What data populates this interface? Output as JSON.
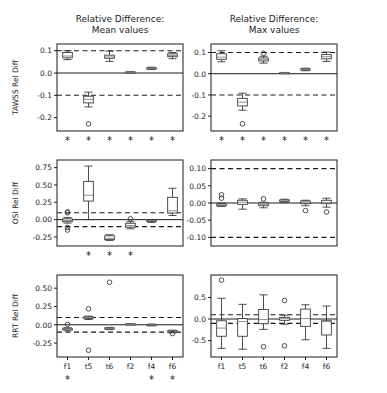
{
  "figure": {
    "width": 387,
    "height": 393,
    "background": "#ffffff",
    "foreground": "#1a1a1a",
    "median_color": "#808080",
    "box_edge_color": "#3a3a3a"
  },
  "column_titles": [
    {
      "line1": "Relative Difference:",
      "line2": "Mean values"
    },
    {
      "line1": "Relative Difference:",
      "line2": "Max values"
    }
  ],
  "row_labels": [
    "TAWSS Rel Diff",
    "OSI Rel Diff",
    "RRT Rel Diff"
  ],
  "categories": [
    "f1",
    "t5",
    "t6",
    "f2",
    "f4",
    "f6"
  ],
  "significance_marker": "*",
  "chart_data": {
    "type": "box",
    "xlabel": "",
    "grid": false,
    "legend": "none",
    "categories": [
      "f1",
      "t5",
      "t6",
      "f2",
      "f4",
      "f6"
    ],
    "panels": [
      {
        "id": "tawss-mean",
        "row": "TAWSS Rel Diff",
        "column": "Relative Difference: Mean values",
        "ylabel": "TAWSS Rel Diff",
        "ylim": [
          -0.26,
          0.13
        ],
        "yticks": [
          0.1,
          0.0,
          -0.1,
          -0.2
        ],
        "yticklabels": [
          "0.1",
          "0.0",
          "-0.1",
          "-0.2"
        ],
        "zero_line": 0.0,
        "threshold_lines": [
          0.1,
          -0.1
        ],
        "significant": [
          true,
          true,
          true,
          true,
          true,
          true
        ],
        "boxes": [
          {
            "category": "f1",
            "whislo": 0.06,
            "q1": 0.068,
            "med": 0.076,
            "q3": 0.092,
            "whishi": 0.1,
            "fliers": []
          },
          {
            "category": "t5",
            "whislo": -0.152,
            "q1": -0.134,
            "med": -0.118,
            "q3": -0.104,
            "whishi": -0.086,
            "fliers": [
              -0.228
            ]
          },
          {
            "category": "t6",
            "whislo": 0.052,
            "q1": 0.066,
            "med": 0.072,
            "q3": 0.08,
            "whishi": 0.098,
            "fliers": []
          },
          {
            "category": "f2",
            "whislo": 0.002,
            "q1": 0.003,
            "med": 0.004,
            "q3": 0.005,
            "whishi": 0.006,
            "fliers": []
          },
          {
            "category": "f4",
            "whislo": 0.016,
            "q1": 0.019,
            "med": 0.021,
            "q3": 0.023,
            "whishi": 0.026,
            "fliers": []
          },
          {
            "category": "f6",
            "whislo": 0.064,
            "q1": 0.073,
            "med": 0.079,
            "q3": 0.086,
            "whishi": 0.092,
            "fliers": []
          }
        ]
      },
      {
        "id": "tawss-max",
        "row": "TAWSS Rel Diff",
        "column": "Relative Difference: Max values",
        "ylabel": "TAWSS Rel Diff",
        "ylim": [
          -0.27,
          0.14
        ],
        "yticks": [
          0.1,
          0.0,
          -0.1,
          -0.2
        ],
        "yticklabels": [
          "0.1",
          "0.0",
          "-0.1",
          "-0.2"
        ],
        "zero_line": 0.0,
        "threshold_lines": [
          0.1,
          -0.1
        ],
        "significant": [
          true,
          true,
          true,
          true,
          true,
          true
        ],
        "boxes": [
          {
            "category": "f1",
            "whislo": 0.056,
            "q1": 0.068,
            "med": 0.078,
            "q3": 0.094,
            "whishi": 0.108,
            "fliers": []
          },
          {
            "category": "t5",
            "whislo": -0.172,
            "q1": -0.152,
            "med": -0.134,
            "q3": -0.116,
            "whishi": -0.092,
            "fliers": [
              -0.236
            ]
          },
          {
            "category": "t6",
            "whislo": 0.05,
            "q1": 0.06,
            "med": 0.066,
            "q3": 0.074,
            "whishi": 0.082,
            "fliers": [
              0.096
            ]
          },
          {
            "category": "f2",
            "whislo": 0.002,
            "q1": 0.003,
            "med": 0.004,
            "q3": 0.005,
            "whishi": 0.006,
            "fliers": []
          },
          {
            "category": "f4",
            "whislo": 0.014,
            "q1": 0.018,
            "med": 0.02,
            "q3": 0.023,
            "whishi": 0.026,
            "fliers": []
          },
          {
            "category": "f6",
            "whislo": 0.058,
            "q1": 0.07,
            "med": 0.08,
            "q3": 0.09,
            "whishi": 0.102,
            "fliers": []
          }
        ]
      },
      {
        "id": "osi-mean",
        "row": "OSI Rel Diff",
        "column": "Relative Difference: Mean values",
        "ylabel": "OSI Rel Diff",
        "ylim": [
          -0.38,
          0.86
        ],
        "yticks": [
          0.75,
          0.5,
          0.25,
          0.0,
          -0.25
        ],
        "yticklabels": [
          "0.75",
          "0.50",
          "0.25",
          "0.00",
          "-0.25"
        ],
        "zero_line": 0.0,
        "threshold_lines": [
          0.1,
          -0.1
        ],
        "significant": [
          false,
          true,
          true,
          true,
          false,
          false
        ],
        "boxes": [
          {
            "category": "f1",
            "whislo": -0.05,
            "q1": -0.03,
            "med": -0.012,
            "q3": 0.012,
            "whishi": 0.032,
            "fliers": [
              0.112,
              0.1,
              -0.112,
              -0.15
            ]
          },
          {
            "category": "t5",
            "whislo": 0.0,
            "q1": 0.268,
            "med": 0.352,
            "q3": 0.552,
            "whishi": 0.772,
            "fliers": []
          },
          {
            "category": "t6",
            "whislo": -0.3,
            "q1": -0.288,
            "med": -0.268,
            "q3": -0.232,
            "whishi": -0.218,
            "fliers": []
          },
          {
            "category": "f2",
            "whislo": -0.132,
            "q1": -0.108,
            "med": -0.086,
            "q3": -0.052,
            "whishi": -0.03,
            "fliers": [
              0.012
            ]
          },
          {
            "category": "f4",
            "whislo": -0.04,
            "q1": -0.024,
            "med": -0.016,
            "q3": -0.008,
            "whishi": 0.002,
            "fliers": []
          },
          {
            "category": "f6",
            "whislo": 0.06,
            "q1": 0.096,
            "med": 0.128,
            "q3": 0.322,
            "whishi": 0.452,
            "fliers": []
          }
        ]
      },
      {
        "id": "osi-max",
        "row": "OSI Rel Diff",
        "column": "Relative Difference: Max values",
        "ylabel": "OSI Rel Diff",
        "ylim": [
          -0.125,
          0.125
        ],
        "yticks": [
          0.1,
          0.05,
          0.0,
          -0.05,
          -0.1
        ],
        "yticklabels": [
          "0.10",
          "0.05",
          "0.00",
          "-0.05",
          "-0.10"
        ],
        "zero_line": 0.0,
        "threshold_lines": [
          0.1,
          -0.1
        ],
        "significant": [
          false,
          false,
          false,
          false,
          false,
          false
        ],
        "boxes": [
          {
            "category": "f1",
            "whislo": -0.01,
            "q1": -0.008,
            "med": -0.005,
            "q3": -0.002,
            "whishi": 0.0,
            "fliers": [
              0.024,
              0.014
            ]
          },
          {
            "category": "t5",
            "whislo": -0.018,
            "q1": -0.004,
            "med": 0.002,
            "q3": 0.008,
            "whishi": 0.012,
            "fliers": []
          },
          {
            "category": "t6",
            "whislo": -0.014,
            "q1": -0.008,
            "med": -0.004,
            "q3": 0.0,
            "whishi": 0.002,
            "fliers": [
              0.012
            ]
          },
          {
            "category": "f2",
            "whislo": 0.002,
            "q1": 0.004,
            "med": 0.006,
            "q3": 0.009,
            "whishi": 0.011,
            "fliers": []
          },
          {
            "category": "f4",
            "whislo": -0.008,
            "q1": -0.002,
            "med": 0.002,
            "q3": 0.006,
            "whishi": 0.008,
            "fliers": [
              -0.022
            ]
          },
          {
            "category": "f6",
            "whislo": -0.012,
            "q1": -0.002,
            "med": 0.002,
            "q3": 0.008,
            "whishi": 0.014,
            "fliers": [
              -0.026
            ]
          }
        ]
      },
      {
        "id": "rrt-mean",
        "row": "RRT Rel Diff",
        "column": "Relative Difference: Mean values",
        "ylabel": "RRT Rel Diff",
        "ylim": [
          -0.44,
          0.68
        ],
        "yticks": [
          0.5,
          0.25,
          0.0,
          -0.25
        ],
        "yticklabels": [
          "0.50",
          "0.25",
          "0.00",
          "-0.25"
        ],
        "zero_line": 0.0,
        "threshold_lines": [
          0.1,
          -0.1
        ],
        "significant": [
          true,
          false,
          false,
          false,
          true,
          true
        ],
        "boxes": [
          {
            "category": "f1",
            "whislo": -0.082,
            "q1": -0.068,
            "med": -0.058,
            "q3": -0.048,
            "whishi": -0.04,
            "fliers": [
              0.006
            ]
          },
          {
            "category": "t5",
            "whislo": 0.072,
            "q1": 0.088,
            "med": 0.098,
            "q3": 0.108,
            "whishi": 0.118,
            "fliers": [
              0.218,
              -0.348
            ]
          },
          {
            "category": "t6",
            "whislo": -0.066,
            "q1": -0.056,
            "med": -0.048,
            "q3": -0.042,
            "whishi": -0.036,
            "fliers": [
              0.58
            ]
          },
          {
            "category": "f2",
            "whislo": 0.006,
            "q1": 0.008,
            "med": 0.01,
            "q3": 0.012,
            "whishi": 0.014,
            "fliers": []
          },
          {
            "category": "f4",
            "whislo": -0.014,
            "q1": -0.008,
            "med": -0.002,
            "q3": 0.004,
            "whishi": 0.01,
            "fliers": []
          },
          {
            "category": "f6",
            "whislo": -0.11,
            "q1": -0.098,
            "med": -0.09,
            "q3": -0.082,
            "whishi": -0.074,
            "fliers": [
              -0.12
            ]
          }
        ]
      },
      {
        "id": "rrt-max",
        "row": "RRT Rel Diff",
        "column": "Relative Difference: Max values",
        "ylabel": "RRT Rel Diff",
        "ylim": [
          -0.88,
          1.02
        ],
        "yticks": [
          0.5,
          0.0,
          -0.5
        ],
        "yticklabels": [
          "0.5",
          "0.0",
          "-0.5"
        ],
        "zero_line": 0.0,
        "threshold_lines": [
          0.1,
          -0.1
        ],
        "significant": [
          false,
          false,
          false,
          false,
          false,
          false
        ],
        "boxes": [
          {
            "category": "f1",
            "whislo": -0.68,
            "q1": -0.4,
            "med": -0.21,
            "q3": -0.04,
            "whishi": 0.48,
            "fliers": [
              0.9
            ]
          },
          {
            "category": "t5",
            "whislo": -0.7,
            "q1": -0.4,
            "med": -0.06,
            "q3": 0.01,
            "whishi": 0.34,
            "fliers": []
          },
          {
            "category": "t6",
            "whislo": -0.24,
            "q1": -0.11,
            "med": -0.01,
            "q3": 0.22,
            "whishi": 0.56,
            "fliers": [
              -0.64
            ]
          },
          {
            "category": "f2",
            "whislo": -0.12,
            "q1": -0.03,
            "med": 0.01,
            "q3": 0.04,
            "whishi": 0.09,
            "fliers": [
              0.43,
              -0.62
            ]
          },
          {
            "category": "f4",
            "whislo": -0.48,
            "q1": -0.17,
            "med": 0.01,
            "q3": 0.23,
            "whishi": 0.33,
            "fliers": []
          },
          {
            "category": "f6",
            "whislo": -0.68,
            "q1": -0.37,
            "med": -0.06,
            "q3": -0.04,
            "whishi": 0.3,
            "fliers": []
          }
        ]
      }
    ]
  }
}
